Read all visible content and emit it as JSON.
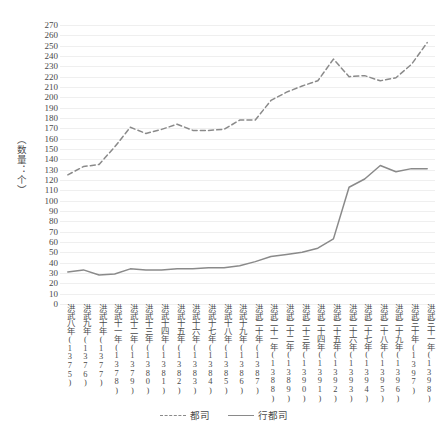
{
  "chart_data": {
    "type": "line",
    "title": "",
    "xlabel": "",
    "ylabel": "（数量：个）",
    "ylim": [
      0,
      270
    ],
    "ytick_step": 10,
    "grid": true,
    "legend_position": "bottom",
    "categories": [
      "洪武八年(1375)",
      "洪武九年(1376)",
      "洪武十年(1377)",
      "洪武十一年(1378)",
      "洪武十二年(1379)",
      "洪武十三年(1380)",
      "洪武十四年(1381)",
      "洪武十五年(1382)",
      "洪武十六年(1383)",
      "洪武十七年(1384)",
      "洪武十八年(1385)",
      "洪武十九年(1386)",
      "洪武二十年(1387)",
      "洪武二十一年(1388)",
      "洪武二十二年(1389)",
      "洪武二十三年(1390)",
      "洪武二十四年(1391)",
      "洪武二十五年(1392)",
      "洪武二十六年(1393)",
      "洪武二十七年(1394)",
      "洪武二十八年(1395)",
      "洪武二十九年(1396)",
      "洪武三十年(1397)",
      "洪武三十一年(1398)"
    ],
    "ytick_labels": [
      "270",
      "260",
      "250",
      "240",
      "230",
      "220",
      "210",
      "200",
      "190",
      "180",
      "170",
      "160",
      "150",
      "140",
      "130",
      "120",
      "110",
      "100",
      "90",
      "80",
      "70",
      "60",
      "50",
      "40",
      "30",
      "20",
      "10",
      "0"
    ],
    "series": [
      {
        "name": "都司",
        "style": "dashed",
        "color": "#8a8a8a",
        "values": [
          125,
          133,
          135,
          152,
          171,
          165,
          169,
          174,
          168,
          168,
          169,
          178,
          178,
          197,
          205,
          211,
          216,
          237,
          220,
          221,
          216,
          219,
          232,
          253
        ]
      },
      {
        "name": "行都司",
        "style": "solid",
        "color": "#8a8a8a",
        "values": [
          31,
          33,
          28,
          29,
          34,
          33,
          33,
          34,
          34,
          35,
          35,
          37,
          41,
          46,
          48,
          50,
          54,
          63,
          113,
          121,
          134,
          128,
          131,
          131
        ]
      }
    ]
  },
  "yaxis": {
    "title": "（数量：个）"
  },
  "legend": {
    "entries": [
      {
        "label": "都司",
        "style": "dashed"
      },
      {
        "label": "行都司",
        "style": "solid"
      }
    ]
  }
}
